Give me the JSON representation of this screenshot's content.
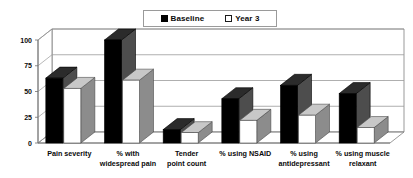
{
  "legend": {
    "position": "top-center",
    "entries": [
      {
        "label": "Baseline",
        "swatch": "filled-square-icon",
        "color": "#000000"
      },
      {
        "label": "Year 3",
        "swatch": "hollow-square-icon",
        "color": "#ffffff"
      }
    ]
  },
  "axis": {
    "y_ticks": [
      "0",
      "25",
      "50",
      "75",
      "100"
    ],
    "y_tick_values": [
      0,
      25,
      50,
      75,
      100
    ]
  },
  "colors": {
    "baseline_front": "#000000",
    "baseline_side": "#4d4d4d",
    "baseline_top": "#2b2b2b",
    "year3_front": "#ffffff",
    "year3_side": "#8c8c8c",
    "year3_top": "#c8c8c8",
    "grid": "#9a9a9a",
    "axis": "#6f6f6f",
    "floor": "#e8e8e8"
  },
  "chart_data": {
    "type": "bar",
    "title": "",
    "subtitle": "",
    "xlabel": "",
    "ylabel": "",
    "ylim": [
      0,
      100
    ],
    "yticks": [
      0,
      25,
      50,
      75,
      100
    ],
    "grid": true,
    "legend_position": "top-center",
    "three_d": true,
    "categories": [
      "Pain severity",
      "% with widespread pain",
      "Tender point count",
      "% using NSAID",
      "% using antidepressant",
      "% using muscle relaxant"
    ],
    "series": [
      {
        "name": "Baseline",
        "values": [
          63,
          100,
          13,
          43,
          56,
          48
        ]
      },
      {
        "name": "Year 3",
        "values": [
          53,
          61,
          10,
          22,
          27,
          15
        ]
      }
    ]
  }
}
